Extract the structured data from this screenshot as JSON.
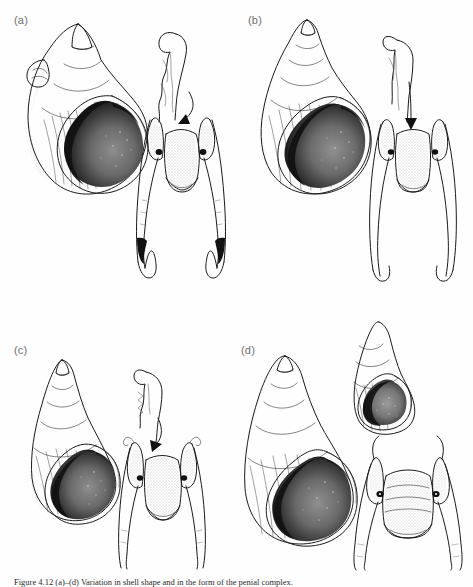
{
  "figure": {
    "panels": [
      {
        "id": "a",
        "label": "(a)",
        "shell": {
          "form": "stout globose shell",
          "aperture": "large dark stippled aperture",
          "whorls": 5
        },
        "anatomy": {
          "structure": "penial complex with wavy flagellum",
          "arrow": true,
          "arrow_direction": "down-left"
        }
      },
      {
        "id": "b",
        "label": "(b)",
        "shell": {
          "form": "ovate shell with elevated spire",
          "aperture": "dark stippled aperture",
          "whorls": 6
        },
        "anatomy": {
          "structure": "penial complex with narrow rectangular lobe",
          "arrow": true,
          "arrow_direction": "down"
        }
      },
      {
        "id": "c",
        "label": "(c)",
        "shell": {
          "form": "elongate conical shell",
          "aperture": "small dark stippled aperture",
          "whorls": 6
        },
        "anatomy": {
          "structure": "penial complex with short hooked flagellum",
          "arrow": true,
          "arrow_direction": "down-right"
        }
      },
      {
        "id": "d",
        "label": "(d)",
        "shell": {
          "form": "large elongate-ovate shell",
          "aperture": "large dark stippled aperture",
          "whorls": 6
        },
        "inset_shell": {
          "form": "small juvenile shell",
          "position": "top-right"
        },
        "anatomy": {
          "structure": "penial complex with broad ribbed lobe",
          "arrow": false
        }
      }
    ],
    "caption": "Figure 4.12  (a)–(d) Variation in shell shape and in the form of the penial complex.",
    "colors": {
      "ink": "#1a1a1a",
      "label": "#6f6f6f",
      "background": "#fefefe"
    }
  }
}
